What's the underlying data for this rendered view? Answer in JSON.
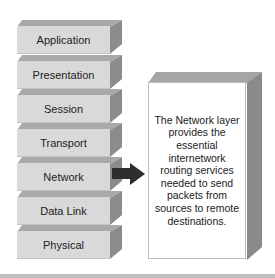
{
  "diagram": {
    "layers": [
      {
        "label": "Application"
      },
      {
        "label": "Presentation"
      },
      {
        "label": "Session"
      },
      {
        "label": "Transport"
      },
      {
        "label": "Network"
      },
      {
        "label": "Data Link"
      },
      {
        "label": "Physical"
      }
    ],
    "highlighted_layer": "Network",
    "callout": {
      "text": "The Network layer provides the essential internetwork routing services needed to send packets from sources to remote destinations."
    },
    "colors": {
      "layer_front": "#d9d9d9",
      "layer_top": "#a9a9a9",
      "layer_side": "#8c8c8c",
      "arrow": "#2e2e2e",
      "callout_front": "#ffffff"
    }
  }
}
